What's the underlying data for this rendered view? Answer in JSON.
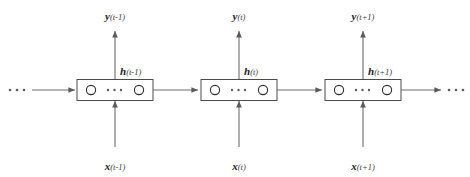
{
  "figure": {
    "name": "unrolled-recurrent-neural-network",
    "background_color": "#ffffff",
    "box_stroke_color": "#4a4a4a",
    "line_color": "#6e6e6e",
    "text_color": "#1c1c1c"
  },
  "edges": {
    "left_ellipsis": "• • •",
    "right_ellipsis": "• • •",
    "cell_ellipsis": "• • •"
  },
  "timesteps": [
    {
      "id": "t-minus-1",
      "output": {
        "symbol": "y",
        "index": "(t-1)"
      },
      "hidden": {
        "symbol": "h",
        "index": "(t-1)"
      },
      "input": {
        "symbol": "x",
        "index": "(t-1)"
      }
    },
    {
      "id": "t",
      "output": {
        "symbol": "y",
        "index": "(t)"
      },
      "hidden": {
        "symbol": "h",
        "index": "(t)"
      },
      "input": {
        "symbol": "x",
        "index": "(t)"
      }
    },
    {
      "id": "t-plus-1",
      "output": {
        "symbol": "y",
        "index": "(t+1)"
      },
      "hidden": {
        "symbol": "h",
        "index": "(t+1)"
      },
      "input": {
        "symbol": "x",
        "index": "(t+1)"
      }
    }
  ]
}
